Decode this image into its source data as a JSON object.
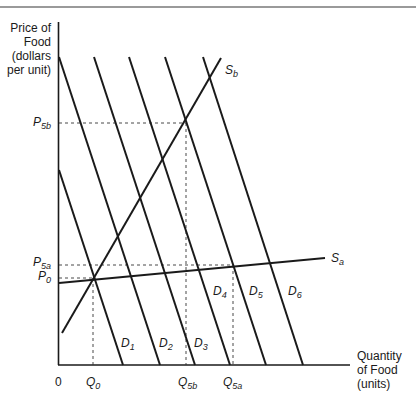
{
  "title_rule": true,
  "axes": {
    "y_label_lines": [
      "Price of",
      "Food",
      "(dollars",
      "per unit)"
    ],
    "x_label_lines": [
      "Quantity",
      "of Food",
      "(units)"
    ],
    "origin": "0"
  },
  "price_labels": [
    {
      "id": "P5b",
      "main": "P",
      "sub": "5b"
    },
    {
      "id": "P5a",
      "main": "P",
      "sub": "5a"
    },
    {
      "id": "P0",
      "main": "P",
      "sub": "0"
    }
  ],
  "quantity_labels": [
    {
      "id": "Q0",
      "main": "Q",
      "sub": "0"
    },
    {
      "id": "Q5b",
      "main": "Q",
      "sub": "5b"
    },
    {
      "id": "Q5a",
      "main": "Q",
      "sub": "5a"
    }
  ],
  "curve_labels": {
    "Sb": {
      "main": "S",
      "sub": "b"
    },
    "Sa": {
      "main": "S",
      "sub": "a"
    },
    "D1": {
      "main": "D",
      "sub": "1"
    },
    "D2": {
      "main": "D",
      "sub": "2"
    },
    "D3": {
      "main": "D",
      "sub": "3"
    },
    "D4": {
      "main": "D",
      "sub": "4"
    },
    "D5": {
      "main": "D",
      "sub": "5"
    },
    "D6": {
      "main": "D",
      "sub": "6"
    }
  },
  "colors": {
    "line": "#1a1a1a",
    "rule": "#9a9a9a",
    "dashed": "#333333"
  },
  "geometry": {
    "demand_curves": [
      {
        "name": "D1",
        "x1": 59,
        "y1": 170,
        "x2": 123,
        "y2": 365
      },
      {
        "name": "D2",
        "x1": 59,
        "y1": 57,
        "x2": 160,
        "y2": 365
      },
      {
        "name": "D3",
        "x1": 94,
        "y1": 57,
        "x2": 195,
        "y2": 365
      },
      {
        "name": "D4",
        "x1": 129,
        "y1": 57,
        "x2": 230,
        "y2": 365
      },
      {
        "name": "D5",
        "x1": 165,
        "y1": 57,
        "x2": 266,
        "y2": 365
      },
      {
        "name": "D6",
        "x1": 203,
        "y1": 57,
        "x2": 303,
        "y2": 365
      }
    ],
    "supply_curves": [
      {
        "name": "Sb",
        "x1": 62,
        "y1": 333,
        "x2": 221,
        "y2": 58
      },
      {
        "name": "Sa",
        "x1": 59,
        "y1": 283,
        "x2": 325,
        "y2": 258
      }
    ]
  }
}
